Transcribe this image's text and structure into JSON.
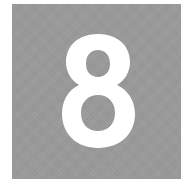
{
  "tile": {
    "digit": "8",
    "background_color": "#9a9a9a",
    "digit_color": "#ffffff"
  }
}
